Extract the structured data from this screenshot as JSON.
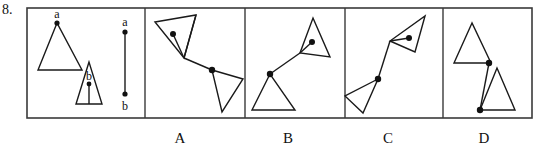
{
  "question": {
    "number": "8.",
    "type": "spatial-reasoning-multiple-choice"
  },
  "frame": {
    "x": 27,
    "y": 8,
    "width": 505,
    "height": 110,
    "border_color": "#3a3a3a",
    "divider_x": [
      145,
      245,
      345,
      443
    ]
  },
  "stimulus_panel": {
    "name": "stimulus",
    "elements": [
      {
        "kind": "triangle",
        "name": "large-triangle",
        "points": "57,23 38,70 82,70",
        "vertex_dot": {
          "cx": 57,
          "cy": 23,
          "r": 2.6
        },
        "label": {
          "text": "a",
          "x": 57,
          "y": 18
        }
      },
      {
        "kind": "triangle",
        "name": "small-triangle",
        "points": "89,62 76,104 102,104",
        "interior_dot": {
          "cx": 89,
          "cy": 84,
          "r": 2.4
        },
        "stem": {
          "x1": 89,
          "y1": 84,
          "x2": 89,
          "y2": 104
        },
        "label": {
          "text": "b",
          "x": 89,
          "y": 80
        }
      },
      {
        "kind": "segment",
        "name": "reference-segment",
        "x1": 125,
        "y1": 32,
        "x2": 125,
        "y2": 94,
        "dot_start": {
          "cx": 125,
          "cy": 32,
          "r": 2.6
        },
        "dot_end": {
          "cx": 125,
          "cy": 94,
          "r": 2.6
        },
        "label_start": {
          "text": "a",
          "x": 125,
          "y": 26
        },
        "label_end": {
          "text": "b",
          "x": 125,
          "y": 110
        }
      }
    ]
  },
  "options": [
    {
      "id": "A",
      "label": "A",
      "label_x": 180,
      "shapes": {
        "triangle_top": "155,22 196,15 184,58",
        "triangle_bottom": "212,70 243,79 222,112",
        "connector": {
          "x1": 184,
          "y1": 58,
          "x2": 212,
          "y2": 70
        },
        "connector_long": {
          "x1": 196,
          "y1": 15,
          "x2": 184,
          "y2": 58
        },
        "dot_a": {
          "cx": 173,
          "cy": 34,
          "r": 3.0
        },
        "dot_a_stem": {
          "x1": 173,
          "y1": 34,
          "x2": 184,
          "y2": 58
        },
        "dot_b": {
          "cx": 212,
          "cy": 70,
          "r": 3.2
        }
      }
    },
    {
      "id": "B",
      "label": "B",
      "label_x": 288,
      "shapes": {
        "triangle_top": "313,18 330,57 300,53",
        "triangle_bottom": "270,74 252,110 295,110",
        "connector": {
          "x1": 300,
          "y1": 53,
          "x2": 270,
          "y2": 74
        },
        "dot_a": {
          "cx": 312,
          "cy": 42,
          "r": 3.0
        },
        "dot_a_stem": {
          "x1": 312,
          "y1": 42,
          "x2": 300,
          "y2": 53
        },
        "dot_b": {
          "cx": 270,
          "cy": 74,
          "r": 3.2
        }
      }
    },
    {
      "id": "C",
      "label": "C",
      "label_x": 388,
      "shapes": {
        "triangle_top": "425,16 415,52 390,41",
        "triangle_bottom": "378,79 345,96 363,113",
        "connector": {
          "x1": 390,
          "y1": 41,
          "x2": 378,
          "y2": 79
        },
        "dot_a": {
          "cx": 409,
          "cy": 38,
          "r": 3.0
        },
        "dot_a_stem": {
          "x1": 409,
          "y1": 38,
          "x2": 390,
          "y2": 41
        },
        "dot_b": {
          "cx": 378,
          "cy": 79,
          "r": 3.2
        }
      }
    },
    {
      "id": "D",
      "label": "D",
      "label_x": 484,
      "shapes": {
        "triangle_top": "472,23 454,63 491,63",
        "triangle_bottom": "497,68 480,110 515,110",
        "connector": {
          "x1": 489,
          "y1": 63,
          "x2": 480,
          "y2": 110
        },
        "dot_a": {
          "cx": 489,
          "cy": 63,
          "r": 3.2
        },
        "dot_b": {
          "cx": 480,
          "cy": 110,
          "r": 3.2
        }
      }
    }
  ],
  "option_label_y": 131
}
